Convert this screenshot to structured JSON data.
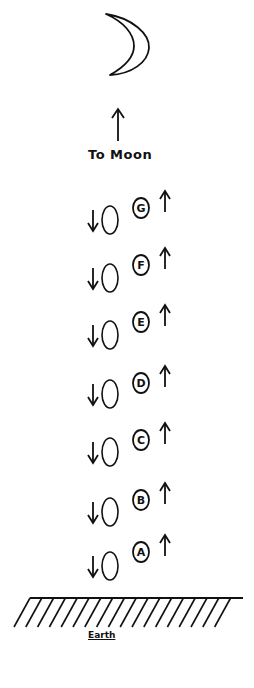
{
  "diagram": {
    "moon_label": "To Moon",
    "earth_label": "Earth",
    "stroke_color": "#111111",
    "background": "#ffffff",
    "rows": [
      {
        "letter": "G",
        "circled_cy": 208,
        "plain_cy": 220
      },
      {
        "letter": "F",
        "circled_cy": 265,
        "plain_cy": 278
      },
      {
        "letter": "E",
        "circled_cy": 322,
        "plain_cy": 335
      },
      {
        "letter": "D",
        "circled_cy": 383,
        "plain_cy": 394
      },
      {
        "letter": "C",
        "circled_cy": 440,
        "plain_cy": 452
      },
      {
        "letter": "B",
        "circled_cy": 500,
        "plain_cy": 512
      },
      {
        "letter": "A",
        "circled_cy": 552,
        "plain_cy": 566
      }
    ]
  }
}
